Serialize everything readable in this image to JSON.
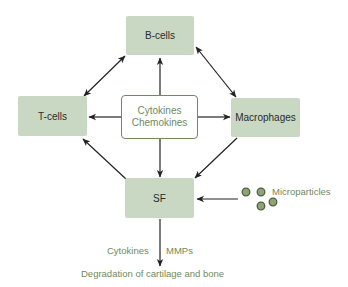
{
  "diagram": {
    "nodes": {
      "b_cells": "B-cells",
      "t_cells": "T-cells",
      "macrophages": "Macrophages",
      "sf": "SF",
      "center_line1": "Cytokines",
      "center_line2": "Chemokines"
    },
    "labels": {
      "microparticles": "Microparticles",
      "cytokines": "Cytokines",
      "mmps": "MMPs",
      "outcome": "Degradation of cartilage and bone"
    },
    "edges": [
      {
        "from": "T-cells",
        "to": "B-cells",
        "type": "bidirectional"
      },
      {
        "from": "B-cells",
        "to": "Macrophages",
        "type": "bidirectional"
      },
      {
        "from": "Cytokines/Chemokines",
        "to": "B-cells",
        "type": "directed"
      },
      {
        "from": "Cytokines/Chemokines",
        "to": "T-cells",
        "type": "directed"
      },
      {
        "from": "Cytokines/Chemokines",
        "to": "Macrophages",
        "type": "directed"
      },
      {
        "from": "Cytokines/Chemokines",
        "to": "SF",
        "type": "directed"
      },
      {
        "from": "SF",
        "to": "T-cells",
        "type": "directed"
      },
      {
        "from": "Macrophages",
        "to": "SF",
        "type": "directed"
      },
      {
        "from": "Microparticles",
        "to": "SF",
        "type": "directed"
      },
      {
        "from": "SF",
        "to": "Degradation of cartilage and bone",
        "type": "directed"
      }
    ],
    "colors": {
      "node_fill": "#c9d8c2",
      "accent_green": "#6f8a62",
      "arrow": "#222222",
      "particle_fill": "#8ea377",
      "particle_stroke": "#4f5f3c"
    }
  }
}
